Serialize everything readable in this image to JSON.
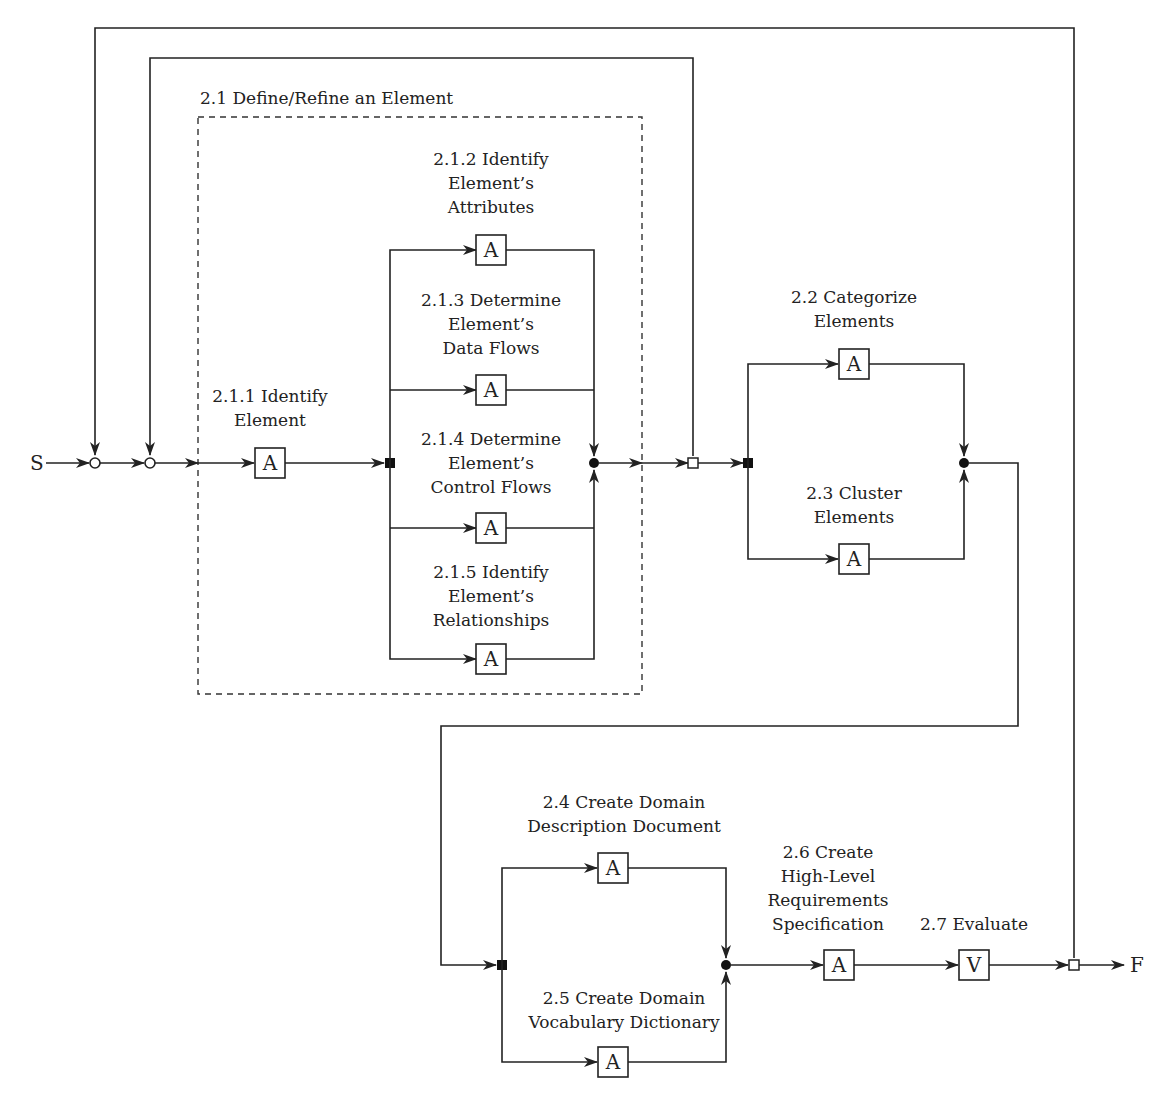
{
  "diagram": {
    "start_label": "S",
    "finish_label": "F",
    "group": {
      "label": "2.1 Define/Refine an Element"
    },
    "tasks": [
      {
        "id": "2.1.1",
        "lines": [
          "2.1.1 Identify",
          "Element"
        ],
        "type": "A"
      },
      {
        "id": "2.1.2",
        "lines": [
          "2.1.2 Identify",
          "Element’s",
          "Attributes"
        ],
        "type": "A"
      },
      {
        "id": "2.1.3",
        "lines": [
          "2.1.3 Determine",
          "Element’s",
          "Data Flows"
        ],
        "type": "A"
      },
      {
        "id": "2.1.4",
        "lines": [
          "2.1.4 Determine",
          "Element’s",
          "Control Flows"
        ],
        "type": "A"
      },
      {
        "id": "2.1.5",
        "lines": [
          "2.1.5 Identify",
          "Element’s",
          "Relationships"
        ],
        "type": "A"
      },
      {
        "id": "2.2",
        "lines": [
          "2.2 Categorize",
          "Elements"
        ],
        "type": "A"
      },
      {
        "id": "2.3",
        "lines": [
          "2.3 Cluster",
          "Elements"
        ],
        "type": "A"
      },
      {
        "id": "2.4",
        "lines": [
          "2.4 Create Domain",
          "Description Document"
        ],
        "type": "A"
      },
      {
        "id": "2.5",
        "lines": [
          "2.5 Create Domain",
          "Vocabulary Dictionary"
        ],
        "type": "A"
      },
      {
        "id": "2.6",
        "lines": [
          "2.6 Create",
          "High-Level",
          "Requirements",
          "Specification"
        ],
        "type": "A"
      },
      {
        "id": "2.7",
        "lines": [
          "2.7 Evaluate"
        ],
        "type": "V"
      }
    ]
  }
}
